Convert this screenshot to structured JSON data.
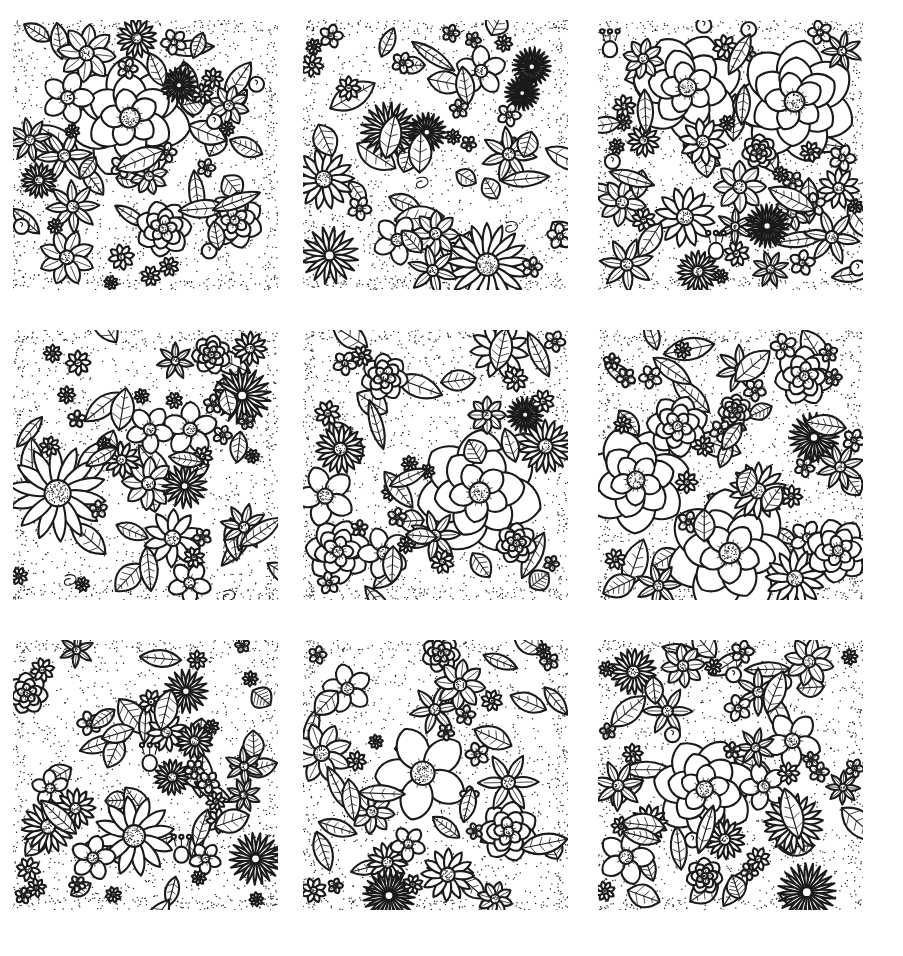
{
  "page": {
    "background_color": "#ffffff",
    "ink_color": "#1a1a1a",
    "width": 903,
    "height": 956,
    "style": "black-and-white hand-drawn line art / coloring book",
    "layout": {
      "type": "grid",
      "rows": 3,
      "columns": 3,
      "tile_count": 9,
      "tile_width": 265,
      "tile_height": 270,
      "column_gap": 25,
      "row_gap": 40
    }
  },
  "tiles": [
    {
      "id": "tile-1",
      "row": 1,
      "column": 1,
      "label": "Large layered rose with daisies and leaves",
      "motifs": [
        "large-layered-rose",
        "daisy",
        "sunflower-disc",
        "broad-leaf",
        "five-petal-blossom",
        "berry-bud"
      ],
      "dominant_flower": "layered-rose",
      "stipple_background": true,
      "seed": 11
    },
    {
      "id": "tile-2",
      "row": 1,
      "column": 2,
      "label": "Dense daisy cluster with cosmos and leaves",
      "motifs": [
        "many-petal-daisy",
        "cosmos",
        "five-petal-blossom",
        "pointed-leaf",
        "spiral-tendril"
      ],
      "dominant_flower": "many-petal-daisy",
      "stipple_background": true,
      "seed": 23
    },
    {
      "id": "tile-3",
      "row": 1,
      "column": 3,
      "label": "Open rose with sunflowers and tulip buds",
      "motifs": [
        "open-rose",
        "sunflower-disc",
        "tulip-bud",
        "veined-leaf",
        "daisy",
        "berry"
      ],
      "dominant_flower": "open-rose",
      "stipple_background": true,
      "seed": 37
    },
    {
      "id": "tile-4",
      "row": 2,
      "column": 1,
      "label": "Star flowers and spiky daisies over stippled ground",
      "motifs": [
        "star-flower",
        "spiky-daisy",
        "five-petal-blossom",
        "sunflower-disc",
        "pointed-leaf",
        "tendril"
      ],
      "dominant_flower": "spiky-daisy",
      "stipple_background": true,
      "seed": 41
    },
    {
      "id": "tile-5",
      "row": 2,
      "column": 2,
      "label": "Central ruffled rose framed by daisies",
      "motifs": [
        "ruffled-rose",
        "many-petal-daisy",
        "cosmos",
        "broad-leaf",
        "small-blossom"
      ],
      "dominant_flower": "ruffled-rose",
      "stipple_background": true,
      "seed": 53
    },
    {
      "id": "tile-6",
      "row": 2,
      "column": 3,
      "label": "Two layered roses with daisies and ribbon blossoms",
      "motifs": [
        "layered-rose",
        "daisy",
        "ribbon-blossom",
        "serrated-leaf",
        "sunflower-disc"
      ],
      "dominant_flower": "layered-rose",
      "stipple_background": true,
      "seed": 67
    },
    {
      "id": "tile-7",
      "row": 3,
      "column": 1,
      "label": "Wide daisies and poppies with bell buds",
      "motifs": [
        "wide-daisy",
        "poppy",
        "bell-bud",
        "fern-leaf",
        "five-petal-blossom",
        "sunflower-disc"
      ],
      "dominant_flower": "wide-daisy",
      "stipple_background": true,
      "seed": 71
    },
    {
      "id": "tile-8",
      "row": 3,
      "column": 2,
      "label": "Heart-petal blossoms with spoke daisies",
      "motifs": [
        "heart-petal-blossom",
        "spoke-daisy",
        "star-flower",
        "long-leaf",
        "layered-rose"
      ],
      "dominant_flower": "heart-petal-blossom",
      "stipple_background": true,
      "seed": 83
    },
    {
      "id": "tile-9",
      "row": 3,
      "column": 3,
      "label": "Three big roses with cherries and leaves",
      "motifs": [
        "layered-rose",
        "star-flower",
        "cherry-berry",
        "veined-leaf",
        "small-blossom"
      ],
      "dominant_flower": "layered-rose",
      "stipple_background": true,
      "seed": 97
    }
  ]
}
